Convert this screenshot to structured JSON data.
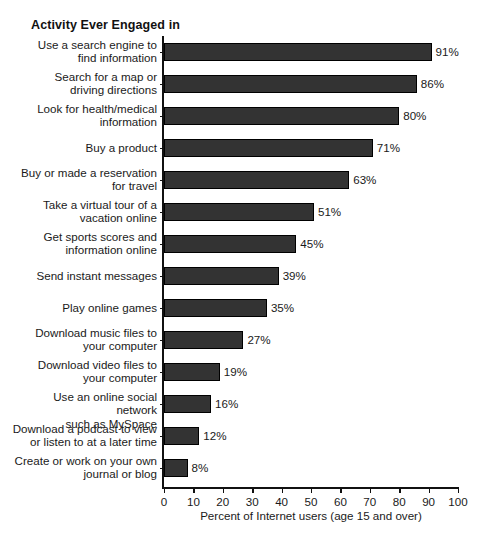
{
  "chart_data": {
    "type": "bar",
    "orientation": "horizontal",
    "title": "Activity Ever Engaged in",
    "xlabel": "Percent of Internet users (age 15 and over)",
    "ylabel": "",
    "xlim": [
      0,
      100
    ],
    "xticks": [
      0,
      10,
      20,
      30,
      40,
      50,
      60,
      70,
      80,
      90,
      100
    ],
    "grid": false,
    "legend": null,
    "bar_color": "#333333",
    "value_suffix": "%",
    "categories": [
      "Use a search engine to find information",
      "Search for a map or driving directions",
      "Look for health/medical information",
      "Buy a product",
      "Buy or made a reservation for travel",
      "Take a virtual tour of a vacation online",
      "Get sports scores and information online",
      "Send instant messages",
      "Play online games",
      "Download music files to your computer",
      "Download video files to your computer",
      "Use an online social network such as MySpace",
      "Download a podcast to view or listen to at a later time",
      "Create or work on your own journal or blog"
    ],
    "values": [
      91,
      86,
      80,
      71,
      63,
      51,
      45,
      39,
      35,
      27,
      19,
      16,
      12,
      8
    ],
    "value_labels": [
      "91%",
      "86%",
      "80%",
      "71%",
      "63%",
      "51%",
      "45%",
      "39%",
      "35%",
      "27%",
      "19%",
      "16%",
      "12%",
      "8%"
    ],
    "category_lines": [
      [
        "Use a search engine to",
        "find information"
      ],
      [
        "Search for a map or",
        "driving directions"
      ],
      [
        "Look for health/medical",
        "information"
      ],
      [
        "Buy a product"
      ],
      [
        "Buy or made a reservation",
        "for travel"
      ],
      [
        "Take a virtual tour of a",
        "vacation online"
      ],
      [
        "Get sports scores and",
        "information online"
      ],
      [
        "Send instant messages"
      ],
      [
        "Play online games"
      ],
      [
        "Download music files to",
        "your computer"
      ],
      [
        "Download video files to",
        "your computer"
      ],
      [
        "Use an online social network",
        "such as MySpace"
      ],
      [
        "Download a podcast to view",
        "or listen to at a later time"
      ],
      [
        "Create or work on your own",
        "journal or blog"
      ]
    ]
  }
}
